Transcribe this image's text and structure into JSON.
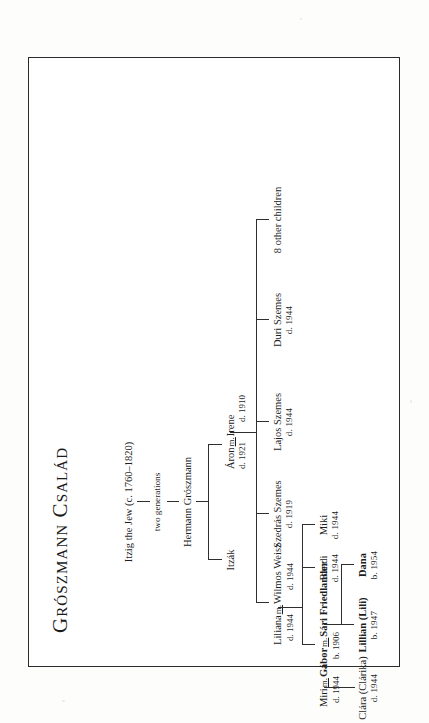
{
  "document": {
    "kind": "genealogy-chart",
    "title": "Grószmann Család",
    "orientation": "landscape-rotated"
  },
  "tree": {
    "generation_1": {
      "id": "itzig",
      "name": "Itzig the Jew",
      "dates": "(c. 1760–1820)",
      "full": "Itzig the Jew (c. 1760–1820)"
    },
    "gap_note": "two generations",
    "generation_2": {
      "id": "hermann",
      "name": "Hermann Grószmann",
      "dates": ""
    },
    "generation_3": [
      {
        "id": "itzak",
        "name": "Itzák",
        "dates": ""
      },
      {
        "id": "aron",
        "name": "Áron",
        "dates": "d. 1921",
        "marriage_mark": "m.",
        "spouse": {
          "id": "irene",
          "name": "Irene",
          "dates": "d. 1910"
        }
      }
    ],
    "generation_4": [
      {
        "id": "szedras",
        "name": "Szedrás Szemes",
        "dates": "d. 1919"
      },
      {
        "id": "lajos",
        "name": "Lajos Szemes",
        "dates": "d. 1944"
      },
      {
        "id": "duri",
        "name": "Duri Szemes",
        "dates": "d. 1944"
      },
      {
        "id": "others",
        "name": "8 other children",
        "dates": ""
      }
    ],
    "generation_4b": {
      "id": "liliana",
      "name": "Liliana",
      "dates": "d. 1944",
      "marriage_mark": "m.",
      "spouse": {
        "id": "wilmos",
        "name": "Wilmos Weisz",
        "dates": "d. 1944"
      }
    },
    "generation_5": [
      {
        "id": "bandi",
        "name": "Bandi",
        "dates": "d. 1944"
      },
      {
        "id": "miki",
        "name": "Miki",
        "dates": "d. 1944"
      },
      {
        "id": "gabor",
        "name": "Gábor",
        "dates": "b. 1906",
        "marriage_mark": "m.",
        "bold": true,
        "spouse": {
          "id": "sari",
          "name": "Sári Friedlander",
          "dates": "",
          "bold": true
        },
        "left_spouse": {
          "id": "miri",
          "name": "Miri",
          "dates": "d. 1944",
          "marriage_mark": "m."
        }
      }
    ],
    "generation_6": [
      {
        "id": "clara",
        "name": "Clára (Clárika)",
        "dates": "d. 1944",
        "bold": false
      },
      {
        "id": "lillian",
        "name": "Lillian (Lili)",
        "dates": "b. 1947",
        "bold": true
      },
      {
        "id": "dana",
        "name": "Dana",
        "dates": "b. 1954",
        "bold": true
      }
    ]
  },
  "colors": {
    "ink": "#1d1d1d",
    "rule": "#2e2e2e",
    "frame": "#2b2b2b",
    "paper": "#ffffff",
    "scan_background": "#fdfdfc"
  }
}
